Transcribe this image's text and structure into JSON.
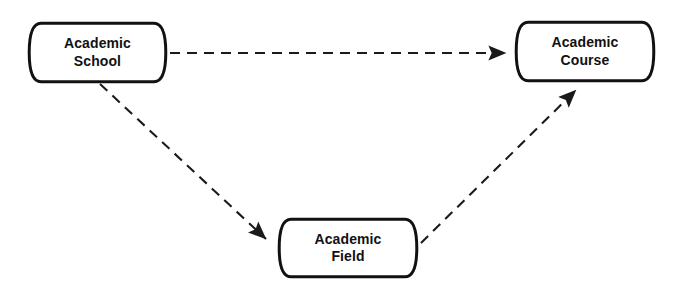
{
  "diagram": {
    "background_color": "#ffffff",
    "line_color": "#1a1a1a",
    "node_fill_color": "#ffffff",
    "node_stroke_color": "#111111",
    "nodes": [
      {
        "id": "academic-school",
        "label": "Academic\nSchool",
        "line1": "Academic",
        "line2": "School",
        "shape": "cylinder",
        "x": 27,
        "y": 21,
        "width": 141,
        "height": 63
      },
      {
        "id": "academic-course",
        "label": "Academic\nCourse",
        "line1": "Academic",
        "line2": "Course",
        "shape": "cylinder",
        "x": 514,
        "y": 20,
        "width": 142,
        "height": 63
      },
      {
        "id": "academic-field",
        "label": "Academic\nField",
        "line1": "Academic",
        "line2": "Field",
        "shape": "cylinder",
        "x": 277,
        "y": 217,
        "width": 142,
        "height": 62
      }
    ],
    "edges": [
      {
        "id": "school-to-course",
        "from": "academic-school",
        "to": "academic-course",
        "style": "dashed",
        "arrow": "end",
        "x1": 170,
        "y1": 53,
        "x2": 512,
        "y2": 53
      },
      {
        "id": "school-to-field",
        "from": "academic-school",
        "to": "academic-field",
        "style": "dashed",
        "arrow": "end",
        "x1": 100,
        "y1": 84,
        "x2": 271,
        "y2": 244
      },
      {
        "id": "field-to-course",
        "from": "academic-field",
        "to": "academic-course",
        "style": "dashed",
        "arrow": "end",
        "x1": 421,
        "y1": 243,
        "x2": 581,
        "y2": 85
      }
    ]
  }
}
